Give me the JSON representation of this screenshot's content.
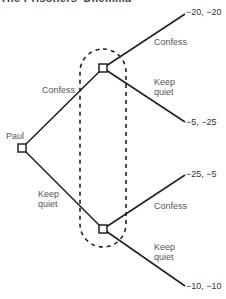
{
  "title": "The Prisoners' Dilemma",
  "root": {
    "player": "Paul"
  },
  "branches": {
    "paul_confess": "Confess",
    "paul_keep_quiet_1": "Keep",
    "paul_keep_quiet_2": "quiet",
    "top_confess": "Confess",
    "top_keep_1": "Keep",
    "top_keep_2": "quiet",
    "bottom_confess": "Confess",
    "bottom_keep_1": "Keep",
    "bottom_keep_2": "quiet"
  },
  "payoffs": {
    "cc": "−20, −20",
    "ck": "−5, −25",
    "kc": "−25, −5",
    "kk": "−10, −10"
  },
  "colors": {
    "line": "#222222",
    "text": "#555555"
  }
}
